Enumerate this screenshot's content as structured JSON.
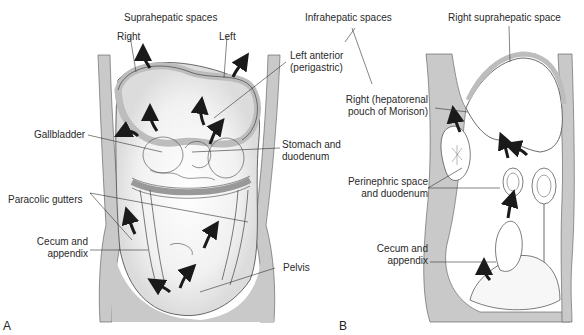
{
  "figure": {
    "panel_a": {
      "letter": "A",
      "labels": {
        "suprahepatic_title": "Suprahepatic spaces",
        "right": "Right",
        "left": "Left",
        "left_anterior_1": "Left anterior",
        "left_anterior_2": "(perigastric)",
        "gallbladder": "Gallbladder",
        "stomach_1": "Stomach and",
        "stomach_2": "duodenum",
        "paracolic": "Paracolic gutters",
        "cecum_1": "Cecum and",
        "cecum_2": "appendix",
        "pelvis": "Pelvis"
      }
    },
    "panel_b": {
      "letter": "B",
      "labels": {
        "infrahepatic_title": "Infrahepatic spaces",
        "right_supra": "Right suprahepatic space",
        "hepatorenal_1": "Right (hepatorenal",
        "hepatorenal_2": "pouch of Morison)",
        "perinephric_1": "Perinephric space",
        "perinephric_2": "and duodenum",
        "cecum_1": "Cecum and",
        "cecum_2": "appendix"
      }
    },
    "colors": {
      "wall": "#c9c9c9",
      "line": "#333333",
      "arrow": "#1a1a1a",
      "shade": "#d8d8d8"
    }
  }
}
